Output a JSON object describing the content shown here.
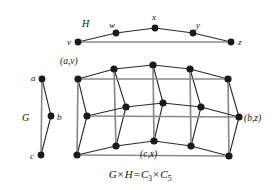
{
  "figure": {
    "caption_parts": {
      "g": "G",
      "times1": "×",
      "h": "H",
      "equals": "=",
      "c": "C",
      "c_sub1": "3",
      "times2": "×",
      "c2": "C",
      "c_sub2": "5"
    },
    "caption_text": "G × H = C3 × C5",
    "colors": {
      "vertex": "#1a1a1a",
      "edge": "#2b2b2b",
      "edge_light": "#8a8a8a",
      "background": "#ffffff",
      "text": "#111111"
    }
  },
  "graph_h": {
    "name_label": "H",
    "name_pos": {
      "x": 82,
      "y": 19
    },
    "type": "cycle",
    "cycle_length": 5,
    "vertices": [
      {
        "id": "v",
        "label": "v",
        "x": 78,
        "y": 42,
        "label_x": 67,
        "label_y": 38
      },
      {
        "id": "w",
        "label": "w",
        "x": 116,
        "y": 33,
        "label_x": 109,
        "label_y": 21
      },
      {
        "id": "x",
        "label": "x",
        "x": 155,
        "y": 28,
        "label_x": 152,
        "label_y": 13
      },
      {
        "id": "y",
        "label": "y",
        "x": 193,
        "y": 33,
        "label_x": 196,
        "label_y": 21
      },
      {
        "id": "z",
        "label": "z",
        "x": 231,
        "y": 42,
        "label_x": 238,
        "label_y": 38
      }
    ],
    "edges": [
      [
        "v",
        "w"
      ],
      [
        "w",
        "x"
      ],
      [
        "x",
        "y"
      ],
      [
        "y",
        "z"
      ],
      [
        "z",
        "v"
      ]
    ]
  },
  "graph_g": {
    "name_label": "G",
    "name_pos": {
      "x": 22,
      "y": 113
    },
    "type": "cycle",
    "cycle_length": 3,
    "vertices": [
      {
        "id": "a",
        "label": "a",
        "x": 42,
        "y": 79,
        "label_x": 31,
        "label_y": 74
      },
      {
        "id": "b",
        "label": "b",
        "x": 51,
        "y": 116,
        "label_x": 57,
        "label_y": 113
      },
      {
        "id": "c",
        "label": "c",
        "x": 41,
        "y": 155,
        "label_x": 30,
        "label_y": 152
      }
    ],
    "edges": [
      [
        "a",
        "b"
      ],
      [
        "b",
        "c"
      ],
      [
        "c",
        "a"
      ]
    ]
  },
  "graph_product": {
    "rows": [
      "a",
      "b",
      "c"
    ],
    "cols": [
      "v",
      "w",
      "x",
      "y",
      "z"
    ],
    "vertices": [
      {
        "id": "av",
        "row": "a",
        "col": "v",
        "x": 78,
        "y": 79
      },
      {
        "id": "aw",
        "row": "a",
        "col": "w",
        "x": 114,
        "y": 69
      },
      {
        "id": "ax",
        "row": "a",
        "col": "x",
        "x": 153,
        "y": 65
      },
      {
        "id": "ay",
        "row": "a",
        "col": "y",
        "x": 190,
        "y": 69
      },
      {
        "id": "az",
        "row": "a",
        "col": "z",
        "x": 228,
        "y": 79
      },
      {
        "id": "bv",
        "row": "b",
        "col": "v",
        "x": 87,
        "y": 116
      },
      {
        "id": "bw",
        "row": "b",
        "col": "w",
        "x": 126,
        "y": 107
      },
      {
        "id": "bx",
        "row": "b",
        "col": "x",
        "x": 163,
        "y": 103
      },
      {
        "id": "by",
        "row": "b",
        "col": "y",
        "x": 201,
        "y": 107
      },
      {
        "id": "bz",
        "row": "b",
        "col": "z",
        "x": 239,
        "y": 117
      },
      {
        "id": "cv",
        "row": "c",
        "col": "v",
        "x": 77,
        "y": 155
      },
      {
        "id": "cw",
        "row": "c",
        "col": "w",
        "x": 116,
        "y": 146
      },
      {
        "id": "cx",
        "row": "c",
        "col": "x",
        "x": 154,
        "y": 141
      },
      {
        "id": "cy",
        "row": "c",
        "col": "y",
        "x": 191,
        "y": 146
      },
      {
        "id": "cz",
        "row": "c",
        "col": "z",
        "x": 229,
        "y": 156
      }
    ],
    "edges_h_direction": [
      [
        "av",
        "aw"
      ],
      [
        "aw",
        "ax"
      ],
      [
        "ax",
        "ay"
      ],
      [
        "ay",
        "az"
      ],
      [
        "az",
        "av"
      ],
      [
        "bv",
        "bw"
      ],
      [
        "bw",
        "bx"
      ],
      [
        "bx",
        "by"
      ],
      [
        "by",
        "bz"
      ],
      [
        "bz",
        "bv"
      ],
      [
        "cv",
        "cw"
      ],
      [
        "cw",
        "cx"
      ],
      [
        "cx",
        "cy"
      ],
      [
        "cy",
        "cz"
      ],
      [
        "cz",
        "cv"
      ]
    ],
    "edges_g_direction": [
      [
        "av",
        "bv"
      ],
      [
        "bv",
        "cv"
      ],
      [
        "cv",
        "av"
      ],
      [
        "aw",
        "bw"
      ],
      [
        "bw",
        "cw"
      ],
      [
        "cw",
        "aw"
      ],
      [
        "ax",
        "bx"
      ],
      [
        "bx",
        "cx"
      ],
      [
        "cx",
        "ax"
      ],
      [
        "ay",
        "by"
      ],
      [
        "by",
        "cy"
      ],
      [
        "cy",
        "ay"
      ],
      [
        "az",
        "bz"
      ],
      [
        "bz",
        "cz"
      ],
      [
        "cz",
        "az"
      ]
    ],
    "labels": [
      {
        "id": "label-av",
        "text": "(a,v)",
        "x": 60,
        "y": 57
      },
      {
        "id": "label-bz",
        "text": "(b,z)",
        "x": 244,
        "y": 114
      },
      {
        "id": "label-cx",
        "text": "(c,x)",
        "x": 140,
        "y": 150
      }
    ]
  }
}
